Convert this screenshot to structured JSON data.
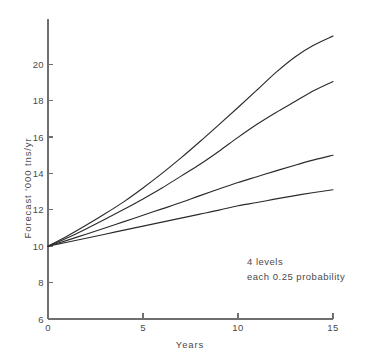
{
  "chart_data": {
    "type": "line",
    "title": "",
    "xlabel": "Years",
    "ylabel": "Forecast '000 tns/yr",
    "xlim": [
      0,
      15
    ],
    "ylim": [
      6,
      21.8
    ],
    "grid": false,
    "legend": "none",
    "x": [
      0,
      1,
      2,
      3,
      4,
      5,
      6,
      7,
      8,
      9,
      10,
      11,
      12,
      13,
      14,
      15
    ],
    "xticks": [
      0,
      5,
      10,
      15
    ],
    "xtick_labels": [
      "0",
      "5",
      "10",
      "15"
    ],
    "yticks": [
      6,
      8,
      10,
      12,
      14,
      16,
      18,
      20
    ],
    "ytick_labels": [
      "6",
      "8",
      "10",
      "12",
      "14",
      "16",
      "18",
      "20"
    ],
    "series": [
      {
        "name": "level-1-highest",
        "values": [
          10.0,
          10.55,
          11.15,
          11.78,
          12.45,
          13.2,
          14.0,
          14.85,
          15.75,
          16.68,
          17.62,
          18.58,
          19.55,
          20.4,
          21.05,
          21.55
        ]
      },
      {
        "name": "level-2",
        "values": [
          10.0,
          10.45,
          10.95,
          11.48,
          12.03,
          12.6,
          13.2,
          13.85,
          14.5,
          15.22,
          15.98,
          16.7,
          17.35,
          17.95,
          18.55,
          19.05
        ]
      },
      {
        "name": "level-3",
        "values": [
          10.0,
          10.32,
          10.66,
          11.0,
          11.35,
          11.7,
          12.05,
          12.4,
          12.78,
          13.14,
          13.5,
          13.82,
          14.14,
          14.45,
          14.74,
          15.0
        ]
      },
      {
        "name": "level-4-lowest",
        "values": [
          10.0,
          10.22,
          10.44,
          10.66,
          10.88,
          11.1,
          11.32,
          11.54,
          11.76,
          11.98,
          12.22,
          12.4,
          12.6,
          12.78,
          12.95,
          13.1
        ]
      }
    ],
    "annotations": [
      {
        "id": "levels-count",
        "text": "4 levels",
        "x": 11.3,
        "y": 9.35
      },
      {
        "id": "level-probability",
        "text": "each 0.25 probability",
        "x": 11.3,
        "y": 8.65
      }
    ],
    "colors": {
      "line": "#2b2b2b",
      "axis": "#6f6f6f",
      "text": "#4a4a4a",
      "background": "#ffffff"
    }
  }
}
